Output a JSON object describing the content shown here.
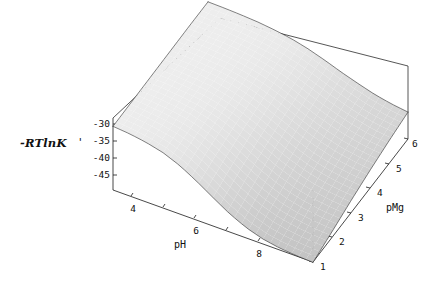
{
  "figure": {
    "type": "surface3d",
    "background_color": "#ffffff",
    "width": 424,
    "height": 288
  },
  "chart_data": {
    "type": "surface",
    "title": "",
    "subtitle": "",
    "xlabel": "pH",
    "ylabel": "pMg",
    "zlabel": "-RTlnK",
    "zlabel_prime": "'",
    "grid": false,
    "legend": "none",
    "mesh_style": "wireframe-shaded",
    "surface_fill_color": "#d9d9d9",
    "mesh_line_color": "#1c1c1c",
    "x": {
      "name": "pH",
      "min": 3,
      "max": 9,
      "ticks": [
        4,
        6,
        8
      ],
      "tick_labels": [
        "4",
        "6",
        "8"
      ],
      "minor_ticks": [
        3,
        5,
        7,
        9
      ]
    },
    "y": {
      "name": "pMg",
      "min": 1,
      "max": 6,
      "ticks": [
        1,
        2,
        3,
        4,
        5,
        6
      ],
      "tick_labels": [
        "1",
        "2",
        "3",
        "4",
        "5",
        "6"
      ]
    },
    "z": {
      "name": "-RTlnK'",
      "min": -47,
      "max": -28,
      "ticks": [
        -30,
        -35,
        -40,
        -45
      ],
      "tick_labels": [
        "-30",
        "-35",
        "-40",
        "-45"
      ],
      "zlim": [
        -47,
        -28
      ]
    },
    "surface_grid": {
      "x_values": [
        3.0,
        3.5,
        4.0,
        4.5,
        5.0,
        5.5,
        6.0,
        6.5,
        7.0,
        7.5,
        8.0,
        8.5,
        9.0
      ],
      "y_values": [
        1.0,
        2.0,
        3.0,
        4.0,
        5.0,
        6.0
      ],
      "z_rows": [
        [
          -30.2,
          -30.6,
          -31.3,
          -32.4,
          -34.2,
          -36.7,
          -39.5,
          -42.2,
          -44.3,
          -45.7,
          -46.5,
          -46.9,
          -47.1
        ],
        [
          -30.1,
          -30.4,
          -30.9,
          -31.7,
          -33.0,
          -35.0,
          -37.4,
          -39.9,
          -42.0,
          -43.6,
          -44.6,
          -45.2,
          -45.5
        ],
        [
          -30.0,
          -30.2,
          -30.6,
          -31.2,
          -32.2,
          -33.7,
          -35.7,
          -37.9,
          -39.9,
          -41.5,
          -42.7,
          -43.4,
          -43.8
        ],
        [
          -29.9,
          -30.1,
          -30.4,
          -30.8,
          -31.6,
          -32.8,
          -34.4,
          -36.3,
          -38.2,
          -39.8,
          -41.0,
          -41.8,
          -42.3
        ],
        [
          -29.8,
          -30.0,
          -30.2,
          -30.6,
          -31.2,
          -32.1,
          -33.4,
          -35.1,
          -36.8,
          -38.3,
          -39.6,
          -40.5,
          -41.0
        ],
        [
          -29.8,
          -29.9,
          -30.1,
          -30.4,
          -30.9,
          -31.6,
          -32.7,
          -34.1,
          -35.7,
          -37.1,
          -38.4,
          -39.3,
          -39.9
        ]
      ]
    }
  },
  "axes": {
    "z_axis": {
      "label": "-RTlnK",
      "prime": "'",
      "tick_labels": [
        "-30",
        "-35",
        "-40",
        "-45"
      ]
    },
    "x_axis": {
      "label": "pH",
      "tick_labels": [
        "4",
        "6",
        "8"
      ]
    },
    "y_axis": {
      "label": "pMg",
      "tick_labels": [
        "1",
        "2",
        "3",
        "4",
        "5",
        "6"
      ]
    }
  }
}
